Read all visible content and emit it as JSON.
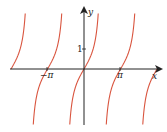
{
  "chart_data": {
    "type": "line",
    "title": "",
    "function": "y = tan x",
    "xlabel": "x",
    "ylabel": "y",
    "x_tick_labels": [
      "−π",
      "π"
    ],
    "x_ticks": [
      -3.14159,
      3.14159
    ],
    "y_tick_labels": [
      "1"
    ],
    "y_ticks": [
      1
    ],
    "xlim": [
      -6.6,
      6.9
    ],
    "ylim": [
      -2.8,
      2.8
    ],
    "asymptotes": [
      -4.712,
      -1.571,
      1.571,
      4.712
    ],
    "zeros": [
      -6.283,
      -3.14159,
      0,
      3.14159,
      6.283
    ],
    "grid": false,
    "legend": null,
    "series": [
      {
        "name": "tan x",
        "color": "#d9553f"
      }
    ]
  },
  "labels": {
    "x_axis": "x",
    "y_axis": "y",
    "neg_pi": "−π",
    "pi": "π",
    "one": "1"
  },
  "colors": {
    "curve": "#d9553f",
    "axis": "#222222"
  }
}
